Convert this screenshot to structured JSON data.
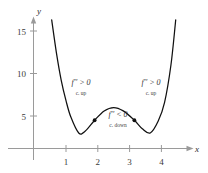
{
  "chart_data": {
    "type": "line",
    "title": "",
    "subtitle": "",
    "xlabel": "x",
    "ylabel": "y",
    "xlim": [
      0,
      4.9
    ],
    "ylim": [
      0,
      17
    ],
    "grid": false,
    "legend": null,
    "x_ticks": [
      "1",
      "2",
      "3",
      "4"
    ],
    "x_tick_values": [
      1,
      2,
      3,
      4
    ],
    "y_ticks": [
      "5",
      "10",
      "15"
    ],
    "y_tick_values": [
      5,
      10,
      15
    ],
    "series": [
      {
        "name": "f(x)",
        "x": [
          0.55,
          0.7,
          0.85,
          1.0,
          1.15,
          1.4,
          1.6,
          1.9,
          2.2,
          2.5,
          2.8,
          3.15,
          3.4,
          3.65,
          3.9,
          4.1,
          4.3,
          4.45
        ],
        "y": [
          16.3,
          12.4,
          9.2,
          6.8,
          4.9,
          3.0,
          3.2,
          4.5,
          5.6,
          6.0,
          5.6,
          4.5,
          3.5,
          3.0,
          4.4,
          6.6,
          11.0,
          16.3
        ]
      }
    ],
    "points": [
      {
        "name": "inflection-point-left",
        "x": 1.9,
        "y": 4.5
      },
      {
        "name": "inflection-point-right",
        "x": 3.15,
        "y": 4.5
      }
    ],
    "annotations": [
      {
        "name": "concave-up-left",
        "expression": "f′′ > 0",
        "caption": "c. up",
        "x": 1.75,
        "y": 9.2
      },
      {
        "name": "concave-down-middle",
        "expression": "f′′ < 0",
        "caption": "c. down",
        "x": 2.55,
        "y": 4.6
      },
      {
        "name": "concave-up-right",
        "expression": "f′′ > 0",
        "caption": "c. up",
        "x": 3.95,
        "y": 9.2
      }
    ],
    "colors": {
      "background": "#ffffff",
      "curve": "#101010",
      "axis": "#9a9a9a",
      "text": "#333333"
    }
  },
  "labels": {
    "y_axis_name": "y",
    "x_axis_name": "x",
    "y_tick_15": "15",
    "y_tick_10": "10",
    "y_tick_5": "5",
    "x_tick_1": "1",
    "x_tick_2": "2",
    "x_tick_3": "3",
    "x_tick_4": "4",
    "ann_left_expr": "f′′ > 0",
    "ann_left_sub": "c. up",
    "ann_mid_expr": "f′′ < 0",
    "ann_mid_sub": "c. down",
    "ann_right_expr": "f′′ > 0",
    "ann_right_sub": "c. up"
  }
}
